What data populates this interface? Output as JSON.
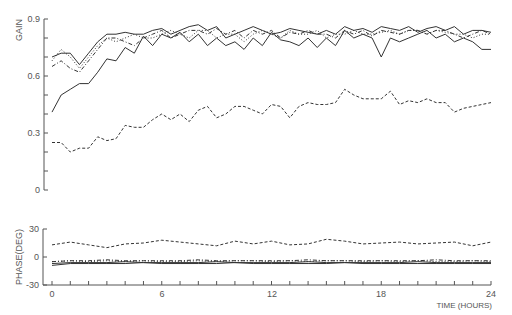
{
  "chart_data": [
    {
      "type": "line",
      "title": "",
      "xlabel": "TIME (HOURS)",
      "ylabel": "GAIN",
      "xlim": [
        0,
        24
      ],
      "ylim": [
        0,
        0.9
      ],
      "yticks": [
        "0",
        "0.3",
        "0.6",
        "0.9"
      ],
      "xticks": [
        "0",
        "6",
        "12",
        "18",
        "24"
      ],
      "grid": false,
      "legend": null,
      "x": [
        0,
        0.5,
        1,
        1.5,
        2,
        2.5,
        3,
        3.5,
        4,
        4.5,
        5,
        5.5,
        6,
        6.5,
        7,
        7.5,
        8,
        8.5,
        9,
        9.5,
        10,
        10.5,
        11,
        11.5,
        12,
        12.5,
        13,
        13.5,
        14,
        14.5,
        15,
        15.5,
        16,
        16.5,
        17,
        17.5,
        18,
        18.5,
        19,
        19.5,
        20,
        20.5,
        21,
        21.5,
        22,
        22.5,
        23,
        23.5,
        24
      ],
      "series": [
        {
          "name": "solid-1",
          "style": "solid",
          "values": [
            0.41,
            0.5,
            0.53,
            0.56,
            0.56,
            0.62,
            0.69,
            0.68,
            0.75,
            0.72,
            0.81,
            0.76,
            0.82,
            0.8,
            0.83,
            0.78,
            0.82,
            0.76,
            0.8,
            0.76,
            0.78,
            0.74,
            0.8,
            0.76,
            0.83,
            0.79,
            0.78,
            0.76,
            0.8,
            0.75,
            0.8,
            0.76,
            0.84,
            0.8,
            0.82,
            0.8,
            0.7,
            0.8,
            0.78,
            0.8,
            0.82,
            0.84,
            0.8,
            0.82,
            0.78,
            0.8,
            0.78,
            0.74,
            0.74
          ]
        },
        {
          "name": "solid-2",
          "style": "solid",
          "values": [
            0.7,
            0.72,
            0.72,
            0.66,
            0.72,
            0.78,
            0.82,
            0.82,
            0.83,
            0.82,
            0.82,
            0.84,
            0.85,
            0.82,
            0.84,
            0.86,
            0.87,
            0.84,
            0.86,
            0.8,
            0.82,
            0.84,
            0.86,
            0.84,
            0.82,
            0.83,
            0.85,
            0.84,
            0.83,
            0.82,
            0.84,
            0.82,
            0.86,
            0.84,
            0.85,
            0.83,
            0.86,
            0.85,
            0.84,
            0.86,
            0.83,
            0.85,
            0.86,
            0.84,
            0.86,
            0.82,
            0.84,
            0.84,
            0.83
          ]
        },
        {
          "name": "dash-dot",
          "style": "dashdot",
          "values": [
            0.65,
            0.68,
            0.64,
            0.62,
            0.68,
            0.74,
            0.8,
            0.8,
            0.78,
            0.76,
            0.8,
            0.82,
            0.84,
            0.8,
            0.82,
            0.84,
            0.84,
            0.82,
            0.85,
            0.82,
            0.84,
            0.8,
            0.84,
            0.82,
            0.84,
            0.8,
            0.83,
            0.82,
            0.84,
            0.82,
            0.82,
            0.8,
            0.84,
            0.82,
            0.84,
            0.81,
            0.84,
            0.83,
            0.82,
            0.84,
            0.84,
            0.82,
            0.84,
            0.84,
            0.82,
            0.8,
            0.82,
            0.84,
            0.82
          ]
        },
        {
          "name": "dotted",
          "style": "dotted",
          "values": [
            0.68,
            0.74,
            0.7,
            0.64,
            0.7,
            0.76,
            0.8,
            0.78,
            0.8,
            0.82,
            0.8,
            0.8,
            0.82,
            0.84,
            0.82,
            0.8,
            0.84,
            0.84,
            0.8,
            0.82,
            0.82,
            0.78,
            0.82,
            0.84,
            0.82,
            0.8,
            0.84,
            0.82,
            0.82,
            0.84,
            0.8,
            0.82,
            0.82,
            0.84,
            0.82,
            0.82,
            0.83,
            0.84,
            0.82,
            0.84,
            0.84,
            0.82,
            0.84,
            0.83,
            0.82,
            0.82,
            0.8,
            0.82,
            0.82
          ]
        },
        {
          "name": "dashed",
          "style": "dashed",
          "values": [
            0.25,
            0.25,
            0.2,
            0.22,
            0.22,
            0.28,
            0.26,
            0.27,
            0.34,
            0.33,
            0.33,
            0.37,
            0.4,
            0.37,
            0.4,
            0.36,
            0.42,
            0.44,
            0.38,
            0.4,
            0.44,
            0.44,
            0.42,
            0.4,
            0.45,
            0.44,
            0.38,
            0.44,
            0.46,
            0.45,
            0.45,
            0.46,
            0.53,
            0.5,
            0.48,
            0.48,
            0.48,
            0.52,
            0.45,
            0.47,
            0.46,
            0.48,
            0.46,
            0.46,
            0.41,
            0.43,
            0.44,
            0.45,
            0.46
          ]
        }
      ]
    },
    {
      "type": "line",
      "title": "",
      "xlabel": "TIME (HOURS)",
      "ylabel": "PHASE (DEG)",
      "xlim": [
        0,
        24
      ],
      "ylim": [
        -30,
        30
      ],
      "yticks": [
        "-30",
        "0",
        "30"
      ],
      "xticks": [
        "0",
        "6",
        "12",
        "18",
        "24"
      ],
      "grid": false,
      "x": [
        0,
        1,
        2,
        3,
        4,
        5,
        6,
        7,
        8,
        9,
        10,
        11,
        12,
        13,
        14,
        15,
        16,
        17,
        18,
        19,
        20,
        21,
        22,
        23,
        24
      ],
      "series": [
        {
          "name": "dashed",
          "style": "dashed",
          "values": [
            13,
            16,
            13,
            10,
            14,
            15,
            18,
            16,
            14,
            12,
            17,
            14,
            17,
            13,
            14,
            19,
            17,
            14,
            15,
            16,
            14,
            15,
            16,
            12,
            16
          ]
        },
        {
          "name": "dash-dot",
          "style": "dashdot",
          "values": [
            -5,
            -4,
            -4,
            -3,
            -4,
            -4,
            -4,
            -4,
            -3,
            -4,
            -4,
            -4,
            -4,
            -4,
            -3,
            -4,
            -4,
            -4,
            -4,
            -4,
            -4,
            -3,
            -4,
            -4,
            -4
          ]
        },
        {
          "name": "dotted",
          "style": "dotted",
          "values": [
            -5,
            -4,
            -5,
            -4,
            -5,
            -4,
            -5,
            -5,
            -4,
            -5,
            -4,
            -4,
            -5,
            -4,
            -5,
            -4,
            -4,
            -5,
            -4,
            -5,
            -4,
            -5,
            -5,
            -4,
            -5
          ]
        },
        {
          "name": "solid-1",
          "style": "solid",
          "values": [
            -7,
            -6,
            -6,
            -6,
            -5,
            -6,
            -6,
            -6,
            -6,
            -5,
            -6,
            -6,
            -6,
            -6,
            -5,
            -6,
            -6,
            -6,
            -6,
            -6,
            -5,
            -6,
            -6,
            -6,
            -6
          ]
        },
        {
          "name": "solid-2",
          "style": "solid",
          "values": [
            -9,
            -7,
            -7,
            -7,
            -7,
            -6,
            -7,
            -7,
            -7,
            -7,
            -6,
            -7,
            -7,
            -7,
            -7,
            -7,
            -6,
            -7,
            -7,
            -7,
            -7,
            -7,
            -7,
            -7,
            -7
          ]
        }
      ]
    }
  ],
  "labels": {
    "gain_axis": "GAIN",
    "phase_axis": "PHASE(DEG)",
    "time_axis": "TIME (HOURS)",
    "gain_ticks": [
      "0.9",
      "0.6",
      "0.3",
      "0"
    ],
    "phase_ticks": [
      "30",
      "0",
      "-30"
    ],
    "x_ticks": [
      "0",
      "6",
      "12",
      "18",
      "24"
    ]
  }
}
